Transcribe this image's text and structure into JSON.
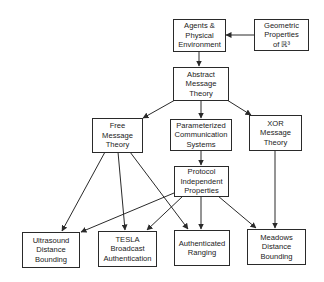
{
  "diagram": {
    "type": "flowchart",
    "nodes": [
      {
        "id": "agents",
        "lines": [
          "Agents &",
          "Physical",
          "Environment"
        ]
      },
      {
        "id": "geometric",
        "lines": [
          "Geometric",
          "Properties",
          "of ℝ³"
        ]
      },
      {
        "id": "abstract",
        "lines": [
          "Abstract",
          "Message",
          "Theory"
        ]
      },
      {
        "id": "free",
        "lines": [
          "Free",
          "Message",
          "Theory"
        ]
      },
      {
        "id": "param",
        "lines": [
          "Parameterized",
          "Communication",
          "Systems"
        ]
      },
      {
        "id": "xor",
        "lines": [
          "XOR",
          "Message",
          "Theory"
        ]
      },
      {
        "id": "protocol",
        "lines": [
          "Protocol",
          "Independent",
          "Properties"
        ]
      },
      {
        "id": "ultrasound",
        "lines": [
          "Ultrasound",
          "Distance",
          "Bounding"
        ]
      },
      {
        "id": "tesla",
        "lines": [
          "TESLA",
          "Broadcast",
          "Authentication"
        ]
      },
      {
        "id": "authranging",
        "lines": [
          "Authenticated",
          "Ranging"
        ]
      },
      {
        "id": "meadows",
        "lines": [
          "Meadows",
          "Distance",
          "Bounding"
        ]
      }
    ],
    "edges": [
      {
        "from": "geometric",
        "to": "agents"
      },
      {
        "from": "agents",
        "to": "abstract"
      },
      {
        "from": "abstract",
        "to": "free"
      },
      {
        "from": "abstract",
        "to": "param"
      },
      {
        "from": "abstract",
        "to": "xor"
      },
      {
        "from": "param",
        "to": "protocol"
      },
      {
        "from": "free",
        "to": "ultrasound"
      },
      {
        "from": "free",
        "to": "tesla"
      },
      {
        "from": "free",
        "to": "authranging"
      },
      {
        "from": "protocol",
        "to": "ultrasound"
      },
      {
        "from": "protocol",
        "to": "tesla"
      },
      {
        "from": "protocol",
        "to": "authranging"
      },
      {
        "from": "protocol",
        "to": "meadows"
      },
      {
        "from": "xor",
        "to": "meadows"
      }
    ],
    "colors": {
      "line": "#2a2a2a",
      "text": "#222222",
      "background": "#ffffff"
    }
  }
}
